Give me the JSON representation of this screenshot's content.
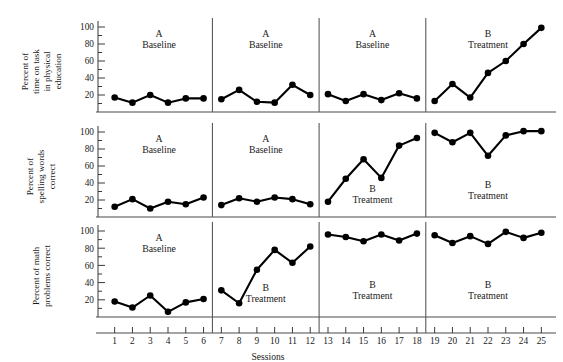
{
  "chart_data": {
    "type": "line",
    "title": "",
    "xlabel": "Sessions",
    "ylabel": "",
    "grid": false,
    "legend": "none",
    "xlim": [
      0.5,
      25.5
    ],
    "ylim": [
      0,
      105
    ],
    "x": [
      1,
      2,
      3,
      4,
      5,
      6,
      7,
      8,
      9,
      10,
      11,
      12,
      13,
      14,
      15,
      16,
      17,
      18,
      19,
      20,
      21,
      22,
      23,
      24,
      25
    ],
    "xtick_labels": [
      "1",
      "2",
      "3",
      "4",
      "5",
      "6",
      "7",
      "8",
      "9",
      "10",
      "11",
      "12",
      "13",
      "14",
      "15",
      "16",
      "17",
      "18",
      "19",
      "20",
      "21",
      "22",
      "23",
      "24",
      "25"
    ],
    "ytick_labels": [
      "20",
      "40",
      "60",
      "80",
      "100"
    ],
    "ytick_values": [
      20,
      40,
      60,
      80,
      100
    ],
    "phase_boundaries": [
      6.5,
      12.5,
      18.5
    ],
    "panels": [
      {
        "ylabel": "Percent of time on task in physical education",
        "ylabel_lines": [
          "Percent of",
          "time on task",
          "in physical",
          "education"
        ],
        "series": [
          {
            "name": "time-on-task",
            "values": [
              17,
              11,
              20,
              11,
              16,
              16,
              15,
              26,
              12,
              11,
              32,
              20,
              21,
              13,
              21,
              14,
              22,
              16,
              13,
              33,
              17,
              46,
              60,
              80,
              99
            ]
          }
        ],
        "phases": [
          {
            "letter": "A",
            "name": "Baseline",
            "start": 1,
            "end": 6
          },
          {
            "letter": "A",
            "name": "Baseline",
            "start": 7,
            "end": 12
          },
          {
            "letter": "A",
            "name": "Baseline",
            "start": 13,
            "end": 18
          },
          {
            "letter": "B",
            "name": "Treatment",
            "start": 19,
            "end": 25
          }
        ]
      },
      {
        "ylabel": "Percent of spelling words correct",
        "ylabel_lines": [
          "Percent of",
          "spelling words",
          "correct"
        ],
        "series": [
          {
            "name": "spelling-words",
            "values": [
              12,
              21,
              10,
              18,
              15,
              23,
              14,
              22,
              18,
              23,
              21,
              15,
              18,
              45,
              68,
              46,
              84,
              93,
              99,
              88,
              99,
              72,
              96,
              101,
              101
            ]
          }
        ],
        "phases": [
          {
            "letter": "A",
            "name": "Baseline",
            "start": 1,
            "end": 6
          },
          {
            "letter": "A",
            "name": "Baseline",
            "start": 7,
            "end": 12
          },
          {
            "letter": "B",
            "name": "Treatment",
            "start": 13,
            "end": 18
          },
          {
            "letter": "B",
            "name": "Treatment",
            "start": 19,
            "end": 25
          }
        ]
      },
      {
        "ylabel": "Percent of math problems correct",
        "ylabel_lines": [
          "Percent of math",
          "problems correct"
        ],
        "series": [
          {
            "name": "math-problems",
            "values": [
              18,
              11,
              25,
              6,
              17,
              21,
              31,
              16,
              55,
              78,
              63,
              82,
              96,
              93,
              88,
              96,
              89,
              97,
              95,
              86,
              94,
              85,
              99,
              92,
              98
            ]
          }
        ],
        "phases": [
          {
            "letter": "A",
            "name": "Baseline",
            "start": 1,
            "end": 6
          },
          {
            "letter": "B",
            "name": "Treatment",
            "start": 7,
            "end": 12
          },
          {
            "letter": "B",
            "name": "Treatment",
            "start": 13,
            "end": 18
          },
          {
            "letter": "B",
            "name": "Treatment",
            "start": 19,
            "end": 25
          }
        ]
      }
    ]
  },
  "figure": {
    "x_axis_title": "Sessions"
  }
}
